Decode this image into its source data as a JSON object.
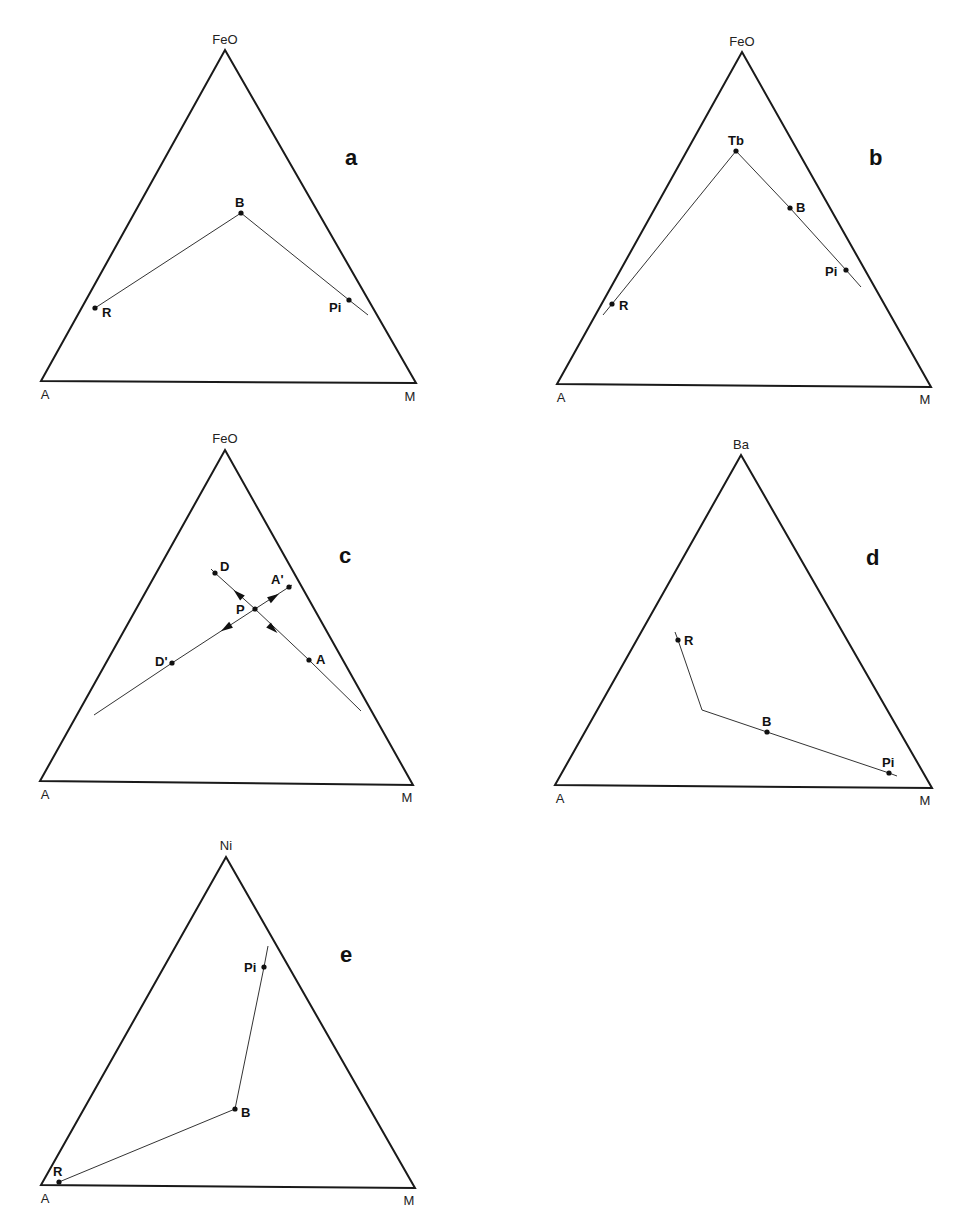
{
  "figure": {
    "panels": [
      {
        "id": "a",
        "label": "a",
        "label_pos": [
          345,
          165
        ],
        "vertices": {
          "top": {
            "label": "FeO",
            "x": 225,
            "y": 50,
            "lx": 225,
            "ly": 44
          },
          "left": {
            "label": "A",
            "x": 41,
            "y": 381,
            "lx": 45,
            "ly": 399
          },
          "right": {
            "label": "M",
            "x": 416,
            "y": 383,
            "lx": 410,
            "ly": 401
          }
        },
        "lines": [
          [
            [
              95,
              308
            ],
            [
              241,
              213
            ],
            [
              349,
              300
            ],
            [
              368,
              315
            ]
          ]
        ],
        "points": [
          {
            "label": "R",
            "x": 95,
            "y": 308,
            "lx": 102,
            "ly": 317
          },
          {
            "label": "B",
            "x": 241,
            "y": 213,
            "lx": 235,
            "ly": 207
          },
          {
            "label": "Pi",
            "x": 349,
            "y": 300,
            "lx": 329,
            "ly": 312
          }
        ],
        "arrows": []
      },
      {
        "id": "b",
        "label": "b",
        "label_pos": [
          869,
          165
        ],
        "vertices": {
          "top": {
            "label": "FeO",
            "x": 742,
            "y": 52,
            "lx": 742,
            "ly": 46
          },
          "left": {
            "label": "A",
            "x": 557,
            "y": 384,
            "lx": 561,
            "ly": 402
          },
          "right": {
            "label": "M",
            "x": 931,
            "y": 387,
            "lx": 925,
            "ly": 404
          }
        },
        "lines": [
          [
            [
              603,
              315
            ],
            [
              612,
              304
            ],
            [
              736,
              151
            ],
            [
              790,
              208
            ],
            [
              846,
              270
            ],
            [
              861,
              287
            ]
          ]
        ],
        "points": [
          {
            "label": "Tb",
            "x": 736,
            "y": 151,
            "lx": 728,
            "ly": 145
          },
          {
            "label": "B",
            "x": 790,
            "y": 208,
            "lx": 796,
            "ly": 212
          },
          {
            "label": "Pi",
            "x": 846,
            "y": 270,
            "lx": 825,
            "ly": 276
          },
          {
            "label": "R",
            "x": 612,
            "y": 304,
            "lx": 619,
            "ly": 310
          }
        ],
        "arrows": []
      },
      {
        "id": "c",
        "label": "c",
        "label_pos": [
          339,
          563
        ],
        "vertices": {
          "top": {
            "label": "FeO",
            "x": 225,
            "y": 450,
            "lx": 225,
            "ly": 443
          },
          "left": {
            "label": "A",
            "x": 40,
            "y": 781,
            "lx": 45,
            "ly": 799
          },
          "right": {
            "label": "M",
            "x": 413,
            "y": 785,
            "lx": 407,
            "ly": 802
          }
        },
        "lines": [
          [
            [
              211,
              569
            ],
            [
              215,
              573
            ],
            [
              255,
              609
            ],
            [
              309,
              660
            ],
            [
              361,
              711
            ]
          ],
          [
            [
              94,
              715
            ],
            [
              172,
              663
            ],
            [
              255,
              609
            ],
            [
              289,
              587
            ],
            [
              292,
              585
            ]
          ]
        ],
        "points": [
          {
            "label": "D",
            "x": 215,
            "y": 573,
            "lx": 220,
            "ly": 571
          },
          {
            "label": "A'",
            "x": 289,
            "y": 587,
            "lx": 271,
            "ly": 584
          },
          {
            "label": "P",
            "x": 255,
            "y": 609,
            "lx": 236,
            "ly": 614
          },
          {
            "label": "A",
            "x": 309,
            "y": 660,
            "lx": 316,
            "ly": 664
          },
          {
            "label": "D'",
            "x": 172,
            "y": 663,
            "lx": 155,
            "ly": 666
          }
        ],
        "arrows": [
          {
            "x": 238,
            "y": 594,
            "angle": -138
          },
          {
            "x": 273,
            "y": 629,
            "angle": 42
          },
          {
            "x": 274,
            "y": 597,
            "angle": -33
          },
          {
            "x": 226,
            "y": 628,
            "angle": 147
          }
        ]
      },
      {
        "id": "d",
        "label": "d",
        "label_pos": [
          866,
          565
        ],
        "vertices": {
          "top": {
            "label": "Ba",
            "x": 741,
            "y": 455,
            "lx": 741,
            "ly": 449
          },
          "left": {
            "label": "A",
            "x": 555,
            "y": 785,
            "lx": 560,
            "ly": 803
          },
          "right": {
            "label": "M",
            "x": 932,
            "y": 788,
            "lx": 925,
            "ly": 805
          }
        },
        "lines": [
          [
            [
              675,
              632
            ],
            [
              678,
              640
            ],
            [
              702,
              710
            ],
            [
              767,
              732
            ],
            [
              889,
              773
            ],
            [
              897,
              776
            ]
          ]
        ],
        "points": [
          {
            "label": "R",
            "x": 678,
            "y": 640,
            "lx": 684,
            "ly": 645
          },
          {
            "label": "B",
            "x": 767,
            "y": 732,
            "lx": 762,
            "ly": 726
          },
          {
            "label": "Pi",
            "x": 889,
            "y": 773,
            "lx": 882,
            "ly": 767
          }
        ],
        "arrows": []
      },
      {
        "id": "e",
        "label": "e",
        "label_pos": [
          340,
          962
        ],
        "vertices": {
          "top": {
            "label": "Ni",
            "x": 226,
            "y": 857,
            "lx": 226,
            "ly": 850
          },
          "left": {
            "label": "A",
            "x": 41,
            "y": 1185,
            "lx": 45,
            "ly": 1203
          },
          "right": {
            "label": "M",
            "x": 415,
            "y": 1188,
            "lx": 409,
            "ly": 1205
          }
        },
        "lines": [
          [
            [
              268,
              946
            ],
            [
              264,
              967
            ],
            [
              235,
              1109
            ],
            [
              59,
              1182
            ]
          ]
        ],
        "points": [
          {
            "label": "Pi",
            "x": 264,
            "y": 967,
            "lx": 244,
            "ly": 972
          },
          {
            "label": "B",
            "x": 235,
            "y": 1109,
            "lx": 241,
            "ly": 1117
          },
          {
            "label": "R",
            "x": 59,
            "y": 1182,
            "lx": 53,
            "ly": 1176
          }
        ],
        "arrows": []
      }
    ]
  }
}
